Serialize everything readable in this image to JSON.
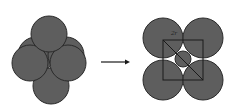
{
  "diagram": {
    "colors": {
      "sphere_fill": "#5e5e5e",
      "sphere_stroke": "#2a2a2a",
      "line": "#1a1a1a",
      "background": "#ffffff"
    },
    "left_cluster": {
      "circles": [
        {
          "cx": 36,
          "cy": 55,
          "r": 18
        },
        {
          "cx": 66,
          "cy": 55,
          "r": 18
        },
        {
          "cx": 51,
          "cy": 86,
          "r": 18
        },
        {
          "cx": 30,
          "cy": 63,
          "r": 18
        },
        {
          "cx": 68,
          "cy": 63,
          "r": 18
        },
        {
          "cx": 49,
          "cy": 34,
          "r": 18
        }
      ]
    },
    "arrow": {
      "x1": 101,
      "y1": 62,
      "x2": 130,
      "y2": 62
    },
    "right_cluster": {
      "circles": [
        {
          "cx": 163,
          "cy": 38,
          "r": 20
        },
        {
          "cx": 203,
          "cy": 38,
          "r": 20
        },
        {
          "cx": 163,
          "cy": 80,
          "r": 20
        },
        {
          "cx": 203,
          "cy": 80,
          "r": 20
        }
      ],
      "small_circle": {
        "cx": 183,
        "cy": 59,
        "r": 8
      },
      "square": {
        "x": 163,
        "y": 40,
        "w": 40,
        "h": 40
      },
      "label": "2r"
    }
  }
}
